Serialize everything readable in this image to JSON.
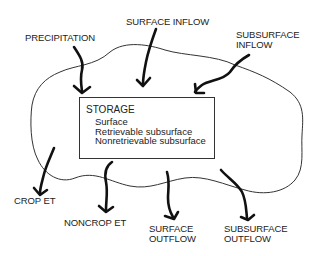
{
  "diagram": {
    "storage": {
      "title": "STORAGE",
      "items": [
        "Surface",
        "Retrievable subsurface",
        "Nonretrievable subsurface"
      ]
    },
    "inflows": [
      {
        "label_lines": [
          "PRECIPITATION"
        ]
      },
      {
        "label_lines": [
          "SURFACE INFLOW"
        ]
      },
      {
        "label_lines": [
          "SUBSURFACE",
          "INFLOW"
        ]
      }
    ],
    "outflows": [
      {
        "label_lines": [
          "CROP ET"
        ]
      },
      {
        "label_lines": [
          "NONCROP ET"
        ]
      },
      {
        "label_lines": [
          "SURFACE",
          "OUTFLOW"
        ]
      },
      {
        "label_lines": [
          "SUBSURFACE",
          "OUTFLOW"
        ]
      }
    ],
    "colors": {
      "ink": "#1a1a1a",
      "background": "#ffffff"
    }
  }
}
